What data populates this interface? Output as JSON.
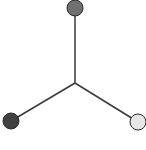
{
  "diagram": {
    "type": "star-graph",
    "center": {
      "x": 75,
      "y": 83
    },
    "edge_color": "#3a3a3a",
    "node_stroke": "#2a2a2a",
    "nodes": [
      {
        "id": "top",
        "x": 75,
        "y": 8,
        "r": 8,
        "fill": "#707070"
      },
      {
        "id": "bottom-left",
        "x": 11,
        "y": 121,
        "r": 8,
        "fill": "#404040"
      },
      {
        "id": "bottom-right",
        "x": 138,
        "y": 122,
        "r": 8,
        "fill": "#e6e6e6"
      }
    ]
  }
}
